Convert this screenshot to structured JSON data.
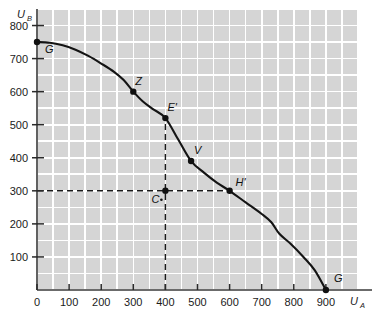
{
  "chart_data": {
    "type": "line",
    "title": "",
    "xlabel": "U_A",
    "ylabel": "U_B",
    "xlabel_main": "U",
    "xlabel_sub": "A",
    "ylabel_main": "U",
    "ylabel_sub": "B",
    "xlim": [
      0,
      1000
    ],
    "ylim": [
      0,
      850
    ],
    "grid": true,
    "legend": "none",
    "xticks": [
      0,
      100,
      200,
      300,
      400,
      500,
      600,
      700,
      800,
      900
    ],
    "xticklabels": [
      "0",
      "100",
      "200",
      "300",
      "400",
      "500",
      "600",
      "700",
      "800",
      "900"
    ],
    "yticks": [
      100,
      200,
      300,
      400,
      500,
      600,
      700,
      800
    ],
    "yticklabels": [
      "100",
      "200",
      "300",
      "400",
      "500",
      "600",
      "700",
      "800"
    ],
    "series": [
      {
        "name": "utility-possibility-frontier",
        "points": [
          [
            0,
            750
          ],
          [
            40,
            748
          ],
          [
            80,
            740
          ],
          [
            120,
            727
          ],
          [
            160,
            708
          ],
          [
            200,
            685
          ],
          [
            240,
            660
          ],
          [
            270,
            635
          ],
          [
            300,
            600
          ],
          [
            330,
            570
          ],
          [
            360,
            548
          ],
          [
            400,
            520
          ],
          [
            440,
            455
          ],
          [
            480,
            390
          ],
          [
            520,
            355
          ],
          [
            560,
            325
          ],
          [
            600,
            300
          ],
          [
            650,
            265
          ],
          [
            700,
            230
          ],
          [
            730,
            205
          ],
          [
            755,
            170
          ],
          [
            790,
            140
          ],
          [
            830,
            100
          ],
          [
            865,
            60
          ],
          [
            900,
            0
          ]
        ]
      }
    ],
    "markers": [
      {
        "label": "G",
        "x": 0,
        "y": 750,
        "dot": true,
        "label_dx": 8,
        "label_dy": 11
      },
      {
        "label": "Z",
        "x": 300,
        "y": 600,
        "dot": true,
        "label_dx": 2,
        "label_dy": -7
      },
      {
        "label": "E'",
        "x": 400,
        "y": 520,
        "dot": true,
        "label_dx": 2,
        "label_dy": -7
      },
      {
        "label": "V",
        "x": 480,
        "y": 390,
        "dot": true,
        "label_dx": 3,
        "label_dy": -7
      },
      {
        "label": "H'",
        "x": 600,
        "y": 300,
        "dot": true,
        "label_dx": 6,
        "label_dy": -5
      },
      {
        "label": "C",
        "x": 400,
        "y": 300,
        "dot": true,
        "label_dx": -14,
        "label_dy": 12
      },
      {
        "label": "G",
        "x": 900,
        "y": 0,
        "dot": true,
        "label_dx": 8,
        "label_dy": -8
      }
    ],
    "guide_lines": [
      {
        "name": "vertical-dashed-at-400",
        "x1": 400,
        "y1": 0,
        "x2": 400,
        "y2": 520
      },
      {
        "name": "horizontal-dashed-at-300",
        "x1": 0,
        "y1": 300,
        "x2": 600,
        "y2": 300
      }
    ],
    "annotations": [
      {
        "name": "c-point-dot-marker",
        "text": "•"
      }
    ],
    "colors": {
      "plot_background": "#d5d5d5",
      "gridline": "#ffffff",
      "curve": "#141414",
      "axis": "#3a3a3a",
      "text": "#1a1a1a",
      "page_background": "#ffffff"
    }
  }
}
